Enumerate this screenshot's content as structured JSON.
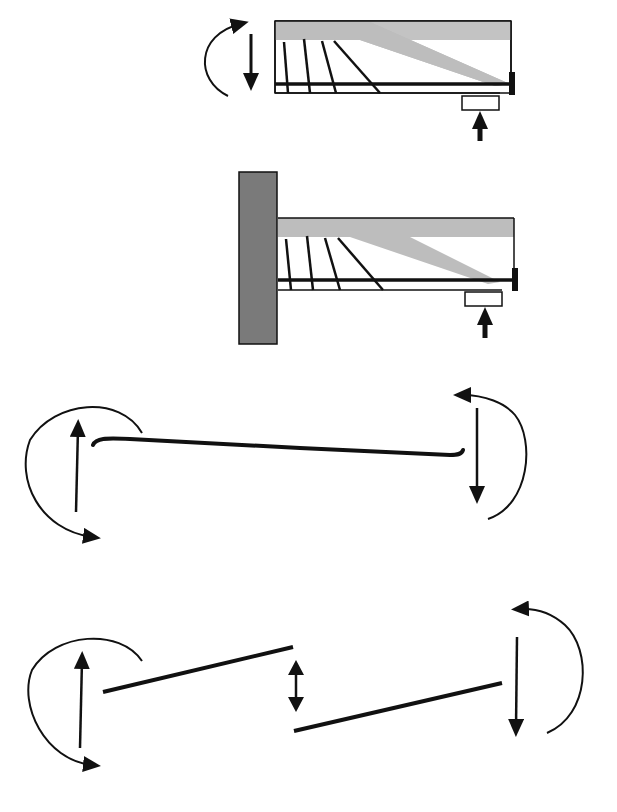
{
  "diagram": {
    "type": "structural-mechanics-illustration",
    "colors": {
      "background": "#ffffff",
      "stroke": "#111111",
      "strut_fill": "#bdbdbd",
      "column_fill": "#7a7a7a",
      "bearing_fill": "#ffffff"
    },
    "panels": [
      {
        "id": "beam-end-free",
        "elements": [
          "concrete-outline",
          "compression-strut",
          "shear-cracks-4",
          "tension-reinforcement",
          "end-anchor-plate",
          "bearing-pad",
          "support-reaction-arrow",
          "applied-moment-arrow",
          "applied-shear-arrow-down"
        ]
      },
      {
        "id": "corbel-on-column",
        "elements": [
          "column",
          "concrete-outline",
          "compression-strut",
          "shear-cracks-4",
          "tension-reinforcement",
          "end-anchor-plate",
          "bearing-pad",
          "support-reaction-arrow"
        ]
      },
      {
        "id": "continuous-beam-deflected",
        "elements": [
          "deflected-beam-curve",
          "left-end-moment-arc",
          "left-shear-arrow-up",
          "right-end-moment-arc",
          "right-shear-arrow-down"
        ]
      },
      {
        "id": "beam-with-shear-slip",
        "elements": [
          "left-beam-segment",
          "right-beam-segment",
          "relative-slip-double-arrow",
          "left-end-moment-arc",
          "left-shear-arrow-up",
          "right-end-moment-arc",
          "right-shear-arrow-down"
        ]
      }
    ]
  }
}
